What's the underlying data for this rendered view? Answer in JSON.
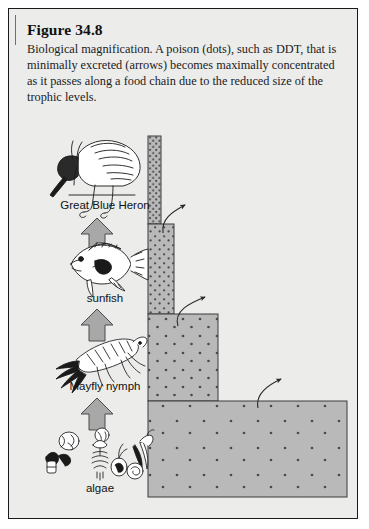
{
  "figure": {
    "title": "Figure 34.8",
    "caption": "Biological magnification. A poison (dots), such as DDT, that is minimally excreted (arrows) becomes maximally concentrated as it passes along a food chain due to the reduced size of the trophic levels."
  },
  "colors": {
    "panel_background": "#ececeb",
    "panel_border": "#1a1a1a",
    "bar_fill": "#b9b9b9",
    "bar_border": "#3a3a3a",
    "block_arrow_fill": "#a8a8a8",
    "block_arrow_border": "#4a4a4a",
    "dot_color": "#4a4a4a",
    "excretion_arrow": "#2a2a2a",
    "text_color": "#111111"
  },
  "trophic_levels": [
    {
      "id": "heron",
      "label": "Great Blue Heron",
      "organism_icon": "great-blue-heron-icon",
      "rank": 4,
      "bar": {
        "x": 139,
        "y": 127,
        "width": 13,
        "height": 88
      },
      "dot_density": "very-high",
      "dot_count": 96
    },
    {
      "id": "sunfish",
      "label": "sunfish",
      "organism_icon": "sunfish-icon",
      "rank": 3,
      "bar": {
        "x": 139,
        "y": 215,
        "width": 26,
        "height": 90
      },
      "dot_density": "high",
      "dot_count": 78
    },
    {
      "id": "mayfly-nymph",
      "label": "Mayfly nymph",
      "organism_icon": "mayfly-nymph-icon",
      "rank": 2,
      "bar": {
        "x": 139,
        "y": 305,
        "width": 70,
        "height": 87
      },
      "dot_density": "medium",
      "dot_count": 52
    },
    {
      "id": "algae",
      "label": "algae",
      "organism_icon": "algae-icon",
      "rank": 1,
      "bar": {
        "x": 139,
        "y": 392,
        "width": 199,
        "height": 96
      },
      "dot_density": "low",
      "dot_count": 44
    }
  ],
  "block_arrows": [
    {
      "id": "algae-to-mayfly",
      "direction": "up",
      "from": "algae",
      "to": "mayfly-nymph"
    },
    {
      "id": "mayfly-to-sunfish",
      "direction": "up",
      "from": "mayfly-nymph",
      "to": "sunfish"
    },
    {
      "id": "sunfish-to-heron",
      "direction": "up",
      "from": "sunfish",
      "to": "heron"
    }
  ],
  "excretion_arrows": [
    {
      "id": "excretion-from-sunfish-bar",
      "meaning": "minimally excreted poison",
      "direction": "up-right"
    },
    {
      "id": "excretion-from-mayfly-bar",
      "meaning": "minimally excreted poison",
      "direction": "up-right"
    },
    {
      "id": "excretion-from-algae-bar",
      "meaning": "minimally excreted poison",
      "direction": "up-right"
    }
  ],
  "chart_data": {
    "type": "bar",
    "orientation": "horizontal-stepped-pyramid",
    "categories": [
      "algae",
      "Mayfly nymph",
      "sunfish",
      "Great Blue Heron"
    ],
    "series": [
      {
        "name": "Biomass / trophic level size (relative width)",
        "values": [
          199,
          70,
          26,
          13
        ]
      },
      {
        "name": "Poison concentration (dots per unit area, relative)",
        "values": [
          1,
          3,
          9,
          27
        ]
      }
    ],
    "xlabel": "Relative size of trophic level",
    "ylabel": "Trophic level",
    "grid": false,
    "legend": "none",
    "annotations": [
      "dots = poison (DDT)",
      "thin curved arrows = minimal excretion",
      "thick block arrows = energy/poison transfer up the food chain"
    ]
  }
}
